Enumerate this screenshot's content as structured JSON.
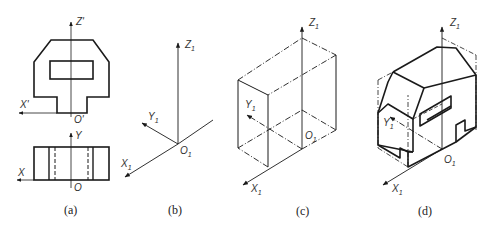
{
  "figures": [
    {
      "id": "a",
      "caption": "(a)",
      "description": "Two orthographic views: front view (top) with axes Z' and X', and top view (bottom) with axes Y and X",
      "labels": {
        "z": "Z'",
        "x_top": "X'",
        "o_top": "O'",
        "y": "Y",
        "x_bottom": "X",
        "o_bottom": "O"
      }
    },
    {
      "id": "b",
      "caption": "(b)",
      "description": "Oblique axonometric axes",
      "labels": {
        "z": "Z",
        "z_sub": "1",
        "y": "Y",
        "y_sub": "1",
        "x": "X",
        "x_sub": "1",
        "o": "O",
        "o_sub": "1"
      }
    },
    {
      "id": "c",
      "caption": "(c)",
      "description": "Bounding box drawn on axonometric axes",
      "labels": {
        "z": "Z",
        "z_sub": "1",
        "y": "Y",
        "y_sub": "1",
        "x": "X",
        "x_sub": "1",
        "o": "O",
        "o_sub": "1"
      }
    },
    {
      "id": "d",
      "caption": "(d)",
      "description": "Completed oblique drawing of the solid inside bounding box",
      "labels": {
        "z": "Z",
        "z_sub": "1",
        "y": "Y",
        "y_sub": "1",
        "x": "X",
        "x_sub": "1",
        "o": "O",
        "o_sub": "1"
      }
    }
  ],
  "colors": {
    "line": "#1a1a1a",
    "thin": "#444444",
    "background": "#ffffff"
  }
}
